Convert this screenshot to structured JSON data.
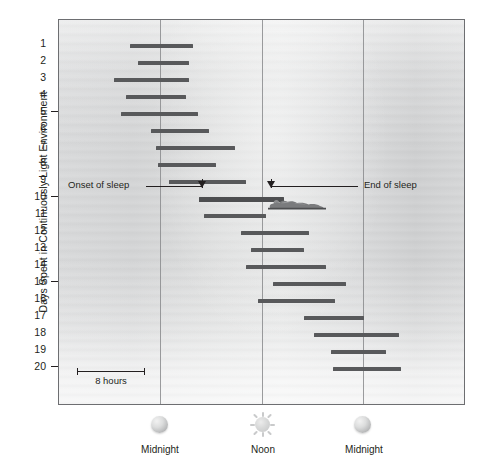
{
  "figure": {
    "kind": "actogram",
    "y_axis_title": "Days Spent in Continuously Light Environment",
    "panel_bg_note": "grayscale gradient photo background"
  },
  "annotations": {
    "onset_label": "Onset of sleep",
    "end_label": "End of sleep",
    "scale_label": "8 hours"
  },
  "x_axis": {
    "labels": [
      "Midnight",
      "Noon",
      "Midnight"
    ],
    "icons": [
      "moon-icon",
      "sun-icon",
      "moon-icon"
    ]
  },
  "y_axis": {
    "ticks_labeled": [
      5,
      10,
      15,
      20
    ],
    "day_numbers": [
      1,
      2,
      3,
      4,
      5,
      6,
      7,
      8,
      9,
      10,
      11,
      12,
      13,
      14,
      15,
      16,
      17,
      18,
      19,
      20
    ]
  },
  "chart_data": {
    "type": "bar",
    "title": "",
    "subtitle": "",
    "xlabel": "",
    "ylabel": "Days Spent in Continuously Light Environment",
    "orientation": "horizontal-span",
    "x_unit": "hours of day",
    "xlim": [
      0,
      48
    ],
    "xtick_values": [
      24,
      36,
      48
    ],
    "xtick_labels": [
      "Midnight",
      "Noon",
      "Midnight"
    ],
    "ylim": [
      20.5,
      0.5
    ],
    "grid": "vertical gridlines at Midnight, Noon, Midnight",
    "legend": "none",
    "bar_color": "#58595b",
    "categories": [
      1,
      2,
      3,
      4,
      5,
      6,
      7,
      8,
      9,
      10,
      11,
      12,
      13,
      14,
      15,
      16,
      17,
      18,
      19,
      20
    ],
    "bars_px": [
      {
        "day": 1,
        "x0": 129,
        "x1": 192
      },
      {
        "day": 2,
        "x0": 137,
        "x1": 188
      },
      {
        "day": 3,
        "x0": 113,
        "x1": 188
      },
      {
        "day": 4,
        "x0": 125,
        "x1": 185
      },
      {
        "day": 5,
        "x0": 120,
        "x1": 197
      },
      {
        "day": 6,
        "x0": 150,
        "x1": 208
      },
      {
        "day": 7,
        "x0": 155,
        "x1": 234
      },
      {
        "day": 8,
        "x0": 157,
        "x1": 215
      },
      {
        "day": 9,
        "x0": 168,
        "x1": 245
      },
      {
        "day": 10,
        "x0": 198,
        "x1": 283
      },
      {
        "day": 11,
        "x0": 203,
        "x1": 265
      },
      {
        "day": 12,
        "x0": 240,
        "x1": 308
      },
      {
        "day": 13,
        "x0": 250,
        "x1": 303
      },
      {
        "day": 14,
        "x0": 245,
        "x1": 325
      },
      {
        "day": 15,
        "x0": 272,
        "x1": 345
      },
      {
        "day": 16,
        "x0": 257,
        "x1": 334
      },
      {
        "day": 17,
        "x0": 303,
        "x1": 363
      },
      {
        "day": 18,
        "x0": 313,
        "x1": 398
      },
      {
        "day": 19,
        "x0": 330,
        "x1": 385
      },
      {
        "day": 20,
        "x0": 332,
        "x1": 400
      }
    ],
    "sleep_onset_hours": [
      14.2,
      15.0,
      12.6,
      13.8,
      13.3,
      16.2,
      16.7,
      16.9,
      18.0,
      21.0,
      21.6,
      25.8,
      26.9,
      26.4,
      29.2,
      27.5,
      32.0,
      33.1,
      35.1,
      35.3
    ],
    "sleep_end_hours": [
      21.0,
      20.5,
      20.5,
      20.2,
      21.7,
      22.9,
      25.7,
      23.6,
      25.2,
      29.5,
      27.5,
      32.2,
      31.6,
      34.0,
      36.2,
      34.9,
      38.4,
      42.1,
      40.6,
      42.2
    ]
  }
}
